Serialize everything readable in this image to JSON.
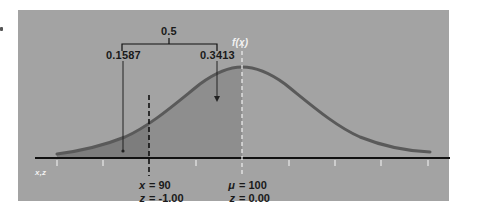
{
  "diagram": {
    "bracket_total_label": "0.5",
    "left_area_label": "0.1587",
    "right_area_label": "0.3413",
    "curve_label": "f(x)",
    "axis_label": "x,z",
    "point_x": {
      "var1": "x",
      "val1": "= 90",
      "var2": "z",
      "val2": "= -1.00"
    },
    "point_mu": {
      "var1": "μ",
      "val1": "= 100",
      "var2": "z",
      "val2": "= 0.00"
    }
  },
  "colors": {
    "panel_bg": "#a3a3a3",
    "curve": "#5a5a5a",
    "shade_left": "#7d7d7d",
    "shade_right": "#8e8e8e",
    "axis": "#111111",
    "mean_line": "#f0f0f0"
  }
}
